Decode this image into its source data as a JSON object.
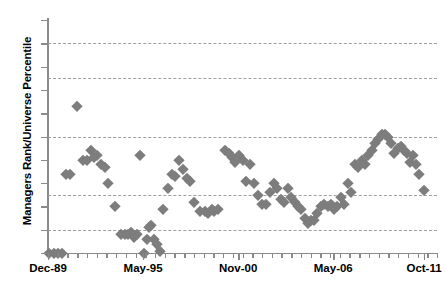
{
  "chart_data": {
    "type": "scatter",
    "title": "",
    "xlabel": "",
    "ylabel": "Managers Rank/Universe Percentile",
    "ylim": [
      0,
      100
    ],
    "y_inverted": true,
    "grid": true,
    "gridlines_y": [
      10,
      25,
      50,
      75,
      90
    ],
    "y_ticks": [
      0,
      10,
      20,
      30,
      40,
      50,
      60,
      70,
      80,
      90,
      100
    ],
    "y_tick_labels": [
      "0",
      "10",
      "20",
      "30",
      "40",
      "50",
      "60",
      "70",
      "80",
      "90",
      "100"
    ],
    "x_tick_labels": [
      "Dec-89",
      "May-95",
      "Nov-00",
      "May-06",
      "Oct-11"
    ],
    "x_tick_positions": [
      0,
      22,
      44,
      66,
      87
    ],
    "x_minor_tick_count": 40,
    "xlim": [
      0,
      90
    ],
    "legend": [],
    "marker": "diamond",
    "marker_color": "#7d7d7d",
    "series": [
      {
        "name": "Managers Rank/Universe Percentile",
        "points": [
          [
            0.3,
            100
          ],
          [
            1.5,
            100
          ],
          [
            2.4,
            100
          ],
          [
            3.2,
            100
          ],
          [
            4.2,
            66
          ],
          [
            5.0,
            66
          ],
          [
            6.6,
            37
          ],
          [
            8.2,
            60
          ],
          [
            9.0,
            60
          ],
          [
            9.9,
            56
          ],
          [
            10.6,
            59
          ],
          [
            11.4,
            58
          ],
          [
            12.3,
            62
          ],
          [
            13.1,
            63
          ],
          [
            13.9,
            70
          ],
          [
            15.4,
            80
          ],
          [
            17.0,
            92
          ],
          [
            17.8,
            92
          ],
          [
            18.6,
            92
          ],
          [
            19.2,
            91
          ],
          [
            19.9,
            93
          ],
          [
            20.6,
            92
          ],
          [
            21.4,
            58
          ],
          [
            22.1,
            100
          ],
          [
            22.8,
            94
          ],
          [
            23.4,
            89
          ],
          [
            23.9,
            88
          ],
          [
            24.5,
            94
          ],
          [
            25.2,
            96
          ],
          [
            25.9,
            99
          ],
          [
            26.7,
            81
          ],
          [
            27.8,
            72
          ],
          [
            28.6,
            66
          ],
          [
            29.4,
            67
          ],
          [
            30.4,
            60
          ],
          [
            31.3,
            64
          ],
          [
            32.1,
            68
          ],
          [
            32.9,
            69
          ],
          [
            33.8,
            78
          ],
          [
            35.2,
            82
          ],
          [
            36.4,
            82
          ],
          [
            37.1,
            83
          ],
          [
            37.9,
            81
          ],
          [
            38.5,
            82
          ],
          [
            39.4,
            81
          ],
          [
            41.0,
            56
          ],
          [
            41.8,
            57
          ],
          [
            42.6,
            59
          ],
          [
            43.3,
            61
          ],
          [
            44.2,
            58
          ],
          [
            45.0,
            60
          ],
          [
            45.9,
            69
          ],
          [
            46.8,
            62
          ],
          [
            47.6,
            70
          ],
          [
            48.6,
            75
          ],
          [
            49.6,
            79
          ],
          [
            50.4,
            79
          ],
          [
            51.3,
            74
          ],
          [
            52.2,
            70
          ],
          [
            53.0,
            72
          ],
          [
            53.9,
            77
          ],
          [
            54.6,
            78
          ],
          [
            55.5,
            72
          ],
          [
            56.3,
            76
          ],
          [
            57.1,
            78
          ],
          [
            57.9,
            80
          ],
          [
            58.6,
            81
          ],
          [
            59.4,
            85
          ],
          [
            60.1,
            87
          ],
          [
            60.8,
            86
          ],
          [
            61.6,
            86
          ],
          [
            62.3,
            83
          ],
          [
            63.1,
            80
          ],
          [
            63.9,
            79
          ],
          [
            64.7,
            80
          ],
          [
            65.4,
            79
          ],
          [
            66.2,
            81
          ],
          [
            66.9,
            80
          ],
          [
            67.7,
            76
          ],
          [
            68.5,
            79
          ],
          [
            69.3,
            70
          ],
          [
            70.2,
            74
          ],
          [
            71.0,
            62
          ],
          [
            71.8,
            63
          ],
          [
            72.6,
            60
          ],
          [
            73.3,
            62
          ],
          [
            74.1,
            58
          ],
          [
            74.9,
            56
          ],
          [
            75.7,
            53
          ],
          [
            76.4,
            51
          ],
          [
            77.2,
            49
          ],
          [
            77.9,
            49
          ],
          [
            78.6,
            50
          ],
          [
            79.4,
            53
          ],
          [
            80.1,
            57
          ],
          [
            80.9,
            55
          ],
          [
            81.6,
            54
          ],
          [
            82.4,
            56
          ],
          [
            83.0,
            57
          ],
          [
            83.7,
            61
          ],
          [
            84.4,
            58
          ],
          [
            85.1,
            62
          ],
          [
            85.9,
            66
          ],
          [
            87.0,
            73
          ]
        ]
      }
    ]
  }
}
